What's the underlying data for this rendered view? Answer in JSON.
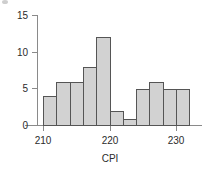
{
  "chart_data": {
    "type": "bar",
    "title": "",
    "subtitle": "",
    "xlabel": "CPI",
    "ylabel": "",
    "bin_width": 2,
    "bin_starts": [
      210,
      212,
      214,
      216,
      218,
      220,
      222,
      224,
      226,
      228,
      230
    ],
    "categories": [
      "210-212",
      "212-214",
      "214-216",
      "216-218",
      "218-220",
      "220-222",
      "222-224",
      "224-226",
      "226-228",
      "228-230",
      "230-232"
    ],
    "values": [
      4,
      6,
      6,
      8,
      12,
      2,
      1,
      5,
      6,
      5,
      5
    ],
    "xlim": [
      208.5,
      233.5
    ],
    "ylim": [
      0,
      15
    ],
    "x_ticks": [
      210,
      220,
      230
    ],
    "x_tick_labels": [
      "210",
      "220",
      "230"
    ],
    "y_ticks": [
      0,
      5,
      10,
      15
    ],
    "y_tick_labels": [
      "0",
      "5",
      "10",
      "15"
    ],
    "grid": false,
    "legend": false,
    "legend_position": "none",
    "bar_fill_color": "#d2d2d2",
    "bar_edge_color": "#555555",
    "axis_color": "#8a8a8a",
    "text_color": "#2b2b2b"
  }
}
